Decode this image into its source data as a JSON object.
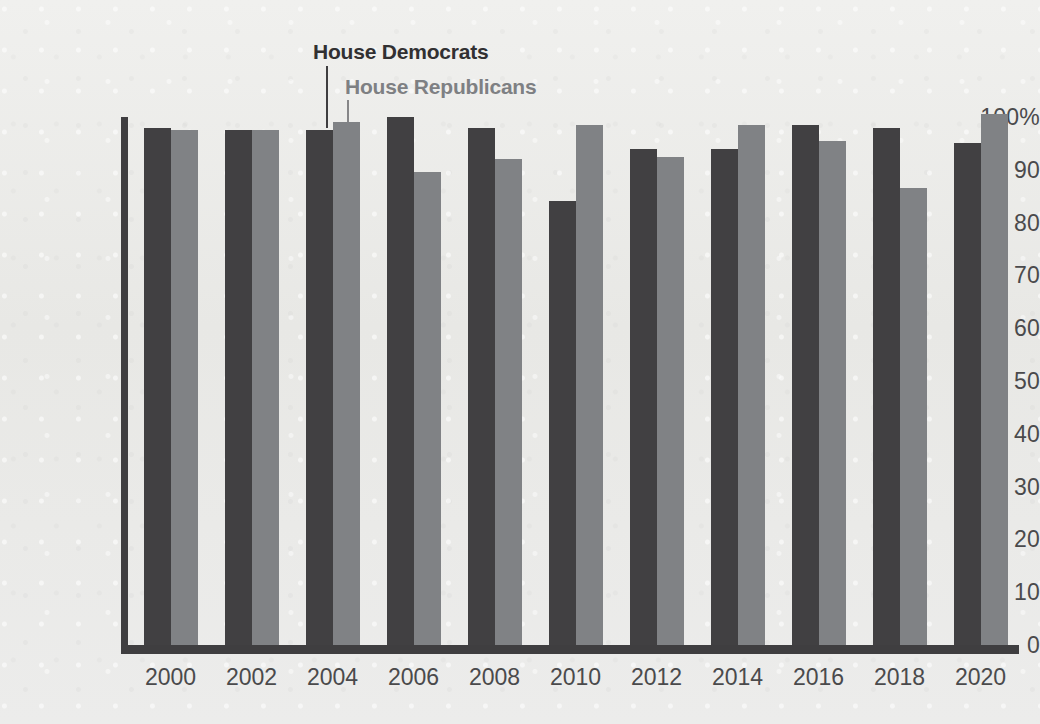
{
  "chart_data": {
    "type": "bar",
    "title": "",
    "subtitle": "",
    "xlabel": "",
    "ylabel": "",
    "ylim": [
      0,
      100
    ],
    "y_ticks": [
      "100%",
      "90",
      "80",
      "70",
      "60",
      "50",
      "40",
      "30",
      "20",
      "10",
      "0"
    ],
    "y_tick_values": [
      100,
      90,
      80,
      70,
      60,
      50,
      40,
      30,
      20,
      10,
      0
    ],
    "grid": false,
    "legend_position": "inline-callout",
    "categories": [
      "2000",
      "2002",
      "2004",
      "2006",
      "2008",
      "2010",
      "2012",
      "2014",
      "2016",
      "2018",
      "2020"
    ],
    "series": [
      {
        "name": "House Democrats",
        "color": "#414042",
        "values": [
          98,
          97.5,
          97.5,
          100,
          98,
          84,
          94,
          94,
          98.5,
          98,
          95
        ]
      },
      {
        "name": "House Republicans",
        "color": "#808285",
        "values": [
          97.5,
          97.5,
          99,
          89.5,
          92,
          98.5,
          92.5,
          98.5,
          95.5,
          86.5,
          100.5
        ]
      }
    ],
    "annotations": [
      {
        "text": "House Democrats",
        "points_to": "2004 House Democrats bar",
        "color": "#313032"
      },
      {
        "text": "House Republicans",
        "points_to": "2004 House Republicans bar",
        "color": "#7e8083"
      }
    ]
  },
  "legend": {
    "democrats_label": "House Democrats",
    "republicans_label": "House Republicans"
  },
  "colors": {
    "democrats": "#414042",
    "republicans": "#808285",
    "axis": "#3f3e40",
    "text": "#4a4a4c",
    "background": "#eaeae8"
  }
}
